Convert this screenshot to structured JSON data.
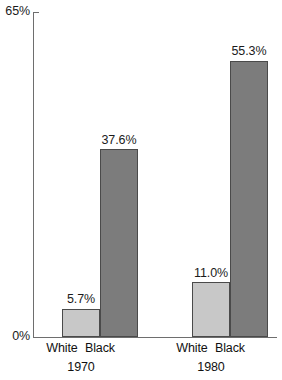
{
  "chart_data": {
    "type": "bar",
    "title": "",
    "subtitle": "",
    "xlabel": "",
    "ylabel": "",
    "ylim": [
      0,
      65
    ],
    "grid": false,
    "legend": "none",
    "y_ticks": [
      "0%",
      "65%"
    ],
    "categories": [
      "1970",
      "1980"
    ],
    "series": [
      {
        "name": "White",
        "values": [
          5.7,
          11.0
        ],
        "color": "#c8c8c8"
      },
      {
        "name": "Black",
        "values": [
          37.6,
          55.3
        ],
        "color": "#7c7c7c"
      }
    ],
    "groups": [
      {
        "group_label": "1970",
        "bars": [
          {
            "label": "White",
            "value": 5.7,
            "value_label": "5.7%",
            "color": "#c8c8c8"
          },
          {
            "label": "Black",
            "value": 37.6,
            "value_label": "37.6%",
            "color": "#7c7c7c"
          }
        ]
      },
      {
        "group_label": "1980",
        "bars": [
          {
            "label": "White",
            "value": 11.0,
            "value_label": "11.0%",
            "color": "#c8c8c8"
          },
          {
            "label": "Black",
            "value": 55.3,
            "value_label": "55.3%",
            "color": "#7c7c7c"
          }
        ]
      }
    ],
    "axis": {
      "y_max_label": "65%",
      "y_min_label": "0%"
    },
    "colors": {
      "white_bar": "#c8c8c8",
      "black_bar": "#7c7c7c",
      "bar_outline": "#4a4a4a",
      "axis": "#6e6e6e",
      "text": "#111111",
      "background": "#ffffff"
    }
  }
}
